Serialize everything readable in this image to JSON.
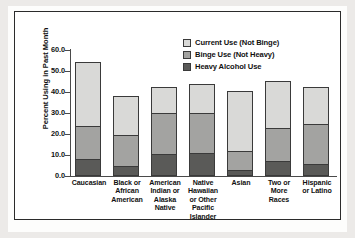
{
  "chart_data": {
    "type": "bar",
    "subtype": "stacked-bar",
    "title": "",
    "xlabel": "",
    "ylabel": "Percent Using in Past Month",
    "ylim": [
      0.0,
      60.0
    ],
    "ytick_step": 10.0,
    "ytick_labels": [
      "60.0",
      "50.0",
      "40.0",
      "30.0",
      "20.0",
      "10.0",
      "0.0"
    ],
    "ytick_values": [
      60.0,
      50.0,
      40.0,
      30.0,
      20.0,
      10.0,
      0.0
    ],
    "grid": false,
    "legend_position": "top-right",
    "categories": [
      "Caucasian",
      "Black or African American",
      "American Indian or Alaska Native",
      "Native Hawaiian or Other Pacific Islander",
      "Asian",
      "Two or More Races",
      "Hispanic or Latino"
    ],
    "category_label_lines": [
      [
        "Caucasian"
      ],
      [
        "Black or",
        "African",
        "American"
      ],
      [
        "American",
        "Indian or",
        "Alaska",
        "Native"
      ],
      [
        "Native",
        "Hawaiian",
        "or Other",
        "Pacific",
        "Islander"
      ],
      [
        "Asian"
      ],
      [
        "Two or",
        "More",
        "Races"
      ],
      [
        "Hispanic",
        "or Latino"
      ]
    ],
    "series": [
      {
        "name": "Heavy Alcohol Use",
        "color": "#5a5a58",
        "values": [
          8.0,
          4.8,
          10.5,
          11.0,
          2.8,
          7.0,
          5.9
        ]
      },
      {
        "name": "Binge Use (Not Heavy)",
        "color": "#a3a3a1",
        "values": [
          15.8,
          14.5,
          19.5,
          19.0,
          8.9,
          15.9,
          19.0
        ]
      },
      {
        "name": "Current Use (Not Binge)",
        "color": "#d9d9d7",
        "values": [
          30.7,
          18.9,
          12.3,
          13.8,
          28.7,
          22.3,
          17.4
        ]
      }
    ],
    "cumulative_tops": [
      {
        "heavy": 8.0,
        "binge": 23.8,
        "total": 54.5
      },
      {
        "heavy": 4.8,
        "binge": 19.3,
        "total": 38.2
      },
      {
        "heavy": 10.5,
        "binge": 30.0,
        "total": 42.3
      },
      {
        "heavy": 11.0,
        "binge": 30.0,
        "total": 43.8
      },
      {
        "heavy": 2.8,
        "binge": 11.7,
        "total": 40.4
      },
      {
        "heavy": 7.0,
        "binge": 22.9,
        "total": 45.2
      },
      {
        "heavy": 5.9,
        "binge": 24.9,
        "total": 42.3
      }
    ],
    "legend": [
      {
        "label": "Current Use (Not Binge)",
        "color": "#d9d9d7"
      },
      {
        "label": "Binge Use (Not Heavy)",
        "color": "#a3a3a1"
      },
      {
        "label": "Heavy Alcohol Use",
        "color": "#5a5a58"
      }
    ]
  }
}
